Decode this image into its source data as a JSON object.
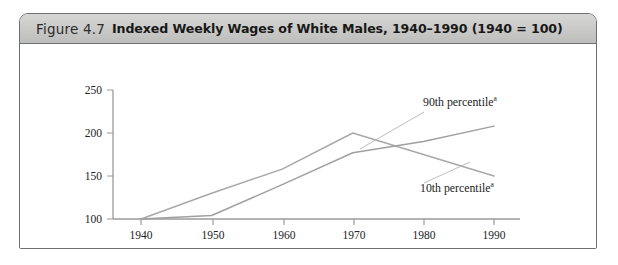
{
  "figure": {
    "number": "Figure 4.7",
    "title": "Indexed Weekly Wages of White Males, 1940–1990 (1940 = 100)"
  },
  "chart_data": {
    "type": "line",
    "title": "Indexed Weekly Wages of White Males, 1940–1990 (1940 = 100)",
    "xlabel": "",
    "ylabel": "",
    "x": [
      1940,
      1950,
      1960,
      1970,
      1980,
      1990
    ],
    "xlim": [
      1935,
      1992
    ],
    "ylim": [
      100,
      250
    ],
    "yticks": [
      100,
      150,
      200,
      250
    ],
    "xticks": [
      "1940",
      "1950",
      "1960",
      "1970",
      "1980",
      "1990"
    ],
    "grid": false,
    "legend": "inline-annotations",
    "series": [
      {
        "name": "10th percentile",
        "footnote_marker": "a",
        "color": "#a8a8a8",
        "values": [
          100,
          130,
          158,
          200,
          175,
          150
        ],
        "label_text": "10th percentile"
      },
      {
        "name": "90th percentile",
        "footnote_marker": "a",
        "color": "#a0a0a0",
        "values": [
          100,
          104,
          140,
          177,
          190,
          208
        ],
        "label_text": "90th percentile"
      }
    ],
    "annotations": [
      {
        "text": "90th percentile",
        "marker": "a",
        "x": 1978,
        "y": 222
      },
      {
        "text": "10th percentile",
        "marker": "a",
        "x": 1977,
        "y": 143
      }
    ]
  },
  "colors": {
    "frame_border": "#6d7073",
    "caption_background": "#c9c9c7",
    "axis": "#9a9a9a",
    "series_line": "#a8a8a8",
    "text": "#1c1c1c"
  }
}
